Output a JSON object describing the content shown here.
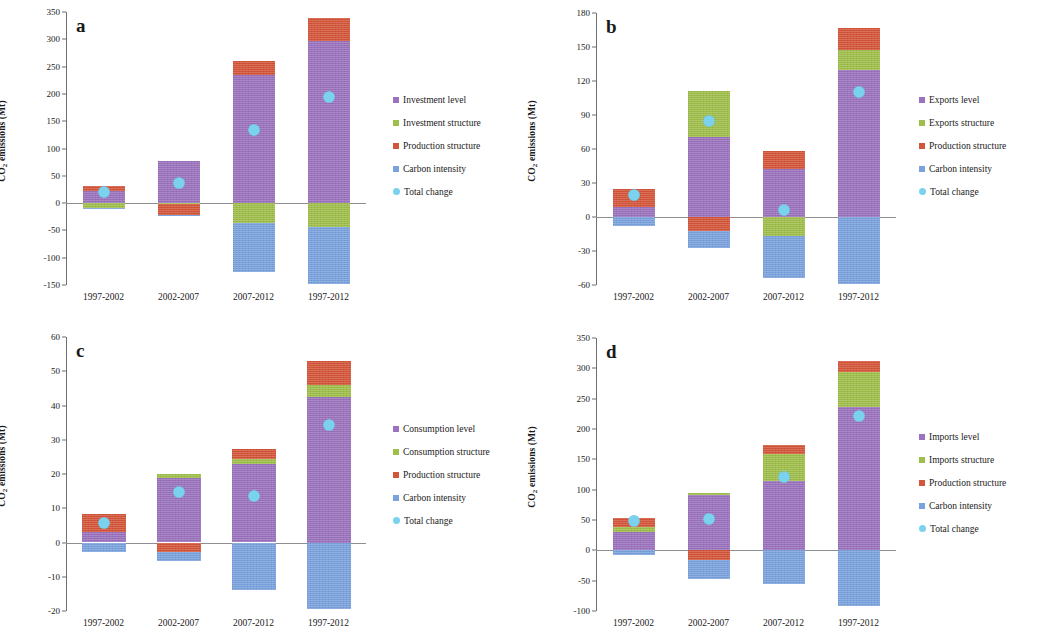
{
  "figure": {
    "axis_title": "CO",
    "axis_title_sub": "2",
    "axis_title_rest": " emissions (Mt)",
    "colors": {
      "level": "#9b72bd",
      "structure": "#9fbe4b",
      "production": "#d4563a",
      "carbon": "#7aa2dd",
      "total": "#7ad2ee",
      "axis": "#8f8f93"
    }
  },
  "chart_data": [
    {
      "type": "bar",
      "panel": "a",
      "title": "a",
      "xlabel": "",
      "ylabel": "CO2 emissions (Mt)",
      "ylim": [
        -150,
        350
      ],
      "yticks": [
        350,
        300,
        250,
        200,
        150,
        100,
        50,
        0,
        -50,
        -100,
        -150
      ],
      "categories": [
        "1997-2002",
        "2002-2007",
        "2007-2012",
        "1997-2012"
      ],
      "stacked": true,
      "grid": false,
      "legend_position": "right",
      "series": [
        {
          "name": "Investment level",
          "color": "#9b72bd",
          "values": [
            22,
            77,
            234,
            297
          ]
        },
        {
          "name": "Investment structure",
          "color": "#9fbe4b",
          "values": [
            -9,
            -1,
            -37,
            -44
          ]
        },
        {
          "name": "Production structure",
          "color": "#d4563a",
          "values": [
            9,
            -20,
            26,
            42
          ]
        },
        {
          "name": "Carbon intensity",
          "color": "#7aa2dd",
          "values": [
            -2,
            -1,
            -90,
            -104
          ]
        }
      ],
      "overlay": {
        "name": "Total change",
        "color": "#7ad2ee",
        "values": [
          20,
          36,
          133,
          194
        ]
      }
    },
    {
      "type": "bar",
      "panel": "b",
      "title": "b",
      "xlabel": "",
      "ylabel": "CO2 emissions (Mt)",
      "ylim": [
        -60,
        180
      ],
      "yticks": [
        180,
        150,
        120,
        90,
        60,
        30,
        0,
        -30,
        -60
      ],
      "categories": [
        "1997-2002",
        "2002-2007",
        "2007-2012",
        "1997-2012"
      ],
      "stacked": true,
      "grid": false,
      "legend_position": "right",
      "series": [
        {
          "name": "Exports level",
          "color": "#9b72bd",
          "values": [
            9,
            71,
            42,
            130
          ]
        },
        {
          "name": "Exports structure",
          "color": "#9fbe4b",
          "values": [
            0,
            40,
            -17,
            17
          ]
        },
        {
          "name": "Production structure",
          "color": "#d4563a",
          "values": [
            16,
            -12,
            16,
            20
          ]
        },
        {
          "name": "Carbon intensity",
          "color": "#7aa2dd",
          "values": [
            -8,
            -15,
            -37,
            -59
          ]
        }
      ],
      "overlay": {
        "name": "Total change",
        "color": "#7ad2ee",
        "values": [
          19,
          85,
          6,
          110
        ]
      }
    },
    {
      "type": "bar",
      "panel": "c",
      "title": "c",
      "xlabel": "",
      "ylabel": "CO2 emissions (Mt)",
      "ylim": [
        -20,
        60
      ],
      "yticks": [
        60,
        50,
        40,
        30,
        20,
        10,
        0,
        -10,
        -20
      ],
      "categories": [
        "1997-2002",
        "2002-2007",
        "2007-2012",
        "1997-2012"
      ],
      "stacked": true,
      "grid": false,
      "legend_position": "right",
      "series": [
        {
          "name": "Consumption level",
          "color": "#9b72bd",
          "values": [
            3.0,
            18.7,
            22.8,
            42.5
          ]
        },
        {
          "name": "Consumption structure",
          "color": "#9fbe4b",
          "values": [
            0,
            1.3,
            1.5,
            3.5
          ]
        },
        {
          "name": "Production structure",
          "color": "#d4563a",
          "values": [
            5.4,
            -2.7,
            3.0,
            7.0
          ]
        },
        {
          "name": "Carbon intensity",
          "color": "#7aa2dd",
          "values": [
            -2.8,
            -2.6,
            -14.0,
            -19.5
          ]
        }
      ],
      "overlay": {
        "name": "Total change",
        "color": "#7ad2ee",
        "values": [
          5.8,
          14.8,
          13.6,
          34.2
        ]
      }
    },
    {
      "type": "bar",
      "panel": "d",
      "title": "d",
      "xlabel": "",
      "ylabel": "CO2 emissions (Mt)",
      "ylim": [
        -100,
        350
      ],
      "yticks": [
        350,
        300,
        250,
        200,
        150,
        100,
        50,
        0,
        -50,
        -100
      ],
      "categories": [
        "1997-2002",
        "2002-2007",
        "2007-2012",
        "1997-2012"
      ],
      "stacked": true,
      "grid": false,
      "legend_position": "right",
      "series": [
        {
          "name": "Imports level",
          "color": "#9b72bd",
          "values": [
            30,
            91,
            114,
            236
          ]
        },
        {
          "name": "Imports structure",
          "color": "#9fbe4b",
          "values": [
            9,
            4,
            44,
            58
          ]
        },
        {
          "name": "Production structure",
          "color": "#d4563a",
          "values": [
            15,
            -16,
            15,
            18
          ]
        },
        {
          "name": "Carbon intensity",
          "color": "#7aa2dd",
          "values": [
            -7,
            -32,
            -55,
            -91
          ]
        }
      ],
      "overlay": {
        "name": "Total change",
        "color": "#7ad2ee",
        "values": [
          48,
          51,
          121,
          221
        ]
      }
    }
  ]
}
